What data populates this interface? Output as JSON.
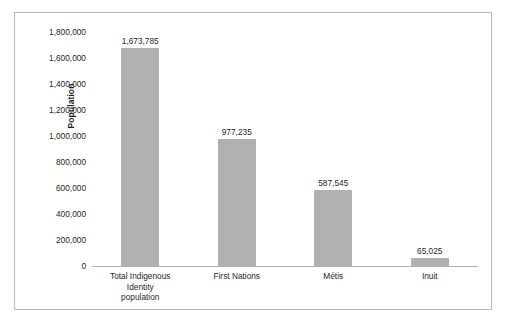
{
  "chart_data": {
    "type": "bar",
    "title": "",
    "subtitle": "",
    "xlabel": "",
    "ylabel": "Population",
    "categories": [
      "Total Indigenous Identity population",
      "First Nations",
      "Métis",
      "Inuit"
    ],
    "values": [
      1673785,
      977235,
      587545,
      65025
    ],
    "value_labels": [
      "1,673,785",
      "977,235",
      "587,545",
      "65,025"
    ],
    "ylim": [
      0,
      1800000
    ],
    "ytick_values": [
      0,
      200000,
      400000,
      600000,
      800000,
      1000000,
      1200000,
      1400000,
      1600000,
      1800000
    ],
    "ytick_labels": [
      "1,800,000",
      "1,600,000",
      "1,400,000",
      "1,200,000",
      "1,000,000",
      "800,000",
      "600,000",
      "400,000",
      "200,000",
      "0"
    ],
    "grid": false,
    "legend": false,
    "legend_position": "none",
    "bar_color": "#b1b1b1",
    "axis_color": "#b0b0b0",
    "text_color": "#231f20",
    "frame_color": "#b8b8b8",
    "background": "#ffffff"
  },
  "axis": {
    "y_title": "Population"
  },
  "categories_wrapped": [
    [
      "Total Indigenous",
      "Identity",
      "population"
    ],
    [
      "First Nations"
    ],
    [
      "Métis"
    ],
    [
      "Inuit"
    ]
  ]
}
